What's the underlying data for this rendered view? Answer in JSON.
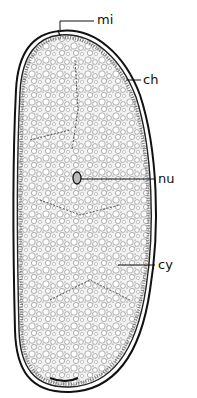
{
  "figure": {
    "colors": {
      "ink": "#111111",
      "background": "#ffffff",
      "stipple": "#555555"
    }
  },
  "labels": [
    {
      "id": "mi",
      "text": "mi",
      "x": 97,
      "y": 13,
      "line": [
        60,
        30,
        94,
        20
      ]
    },
    {
      "id": "ch",
      "text": "ch",
      "x": 143,
      "y": 73,
      "line": [
        124,
        80,
        141,
        80
      ]
    },
    {
      "id": "nu",
      "text": "nu",
      "x": 158,
      "y": 172,
      "line": [
        80,
        179,
        155,
        179
      ]
    },
    {
      "id": "cy",
      "text": "cy",
      "x": 158,
      "y": 258,
      "line": [
        118,
        265,
        155,
        265
      ]
    }
  ]
}
